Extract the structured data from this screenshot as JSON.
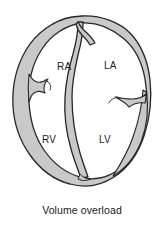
{
  "figure": {
    "title": "Volume overload",
    "caption": "Volume overload",
    "chamber_labels": {
      "right_atrium": "RA",
      "left_atrium": "LA",
      "right_ventricle": "RV",
      "left_ventricle": "LV"
    },
    "colors": {
      "background": "#ffffff",
      "outline": "#262626",
      "wall_fill": "#c9c9c9",
      "chamber_fill": "#ffffff",
      "text": "#1a1a1a"
    }
  }
}
